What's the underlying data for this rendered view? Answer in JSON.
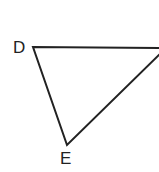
{
  "diagram": {
    "type": "triangle",
    "vertices": [
      {
        "label": "D",
        "x": 33,
        "y": 47
      },
      {
        "label": "",
        "x": 162,
        "y": 48
      },
      {
        "label": "E",
        "x": 67,
        "y": 145
      }
    ],
    "labels": {
      "d": "D",
      "e": "E"
    },
    "stroke_color": "#222222"
  }
}
